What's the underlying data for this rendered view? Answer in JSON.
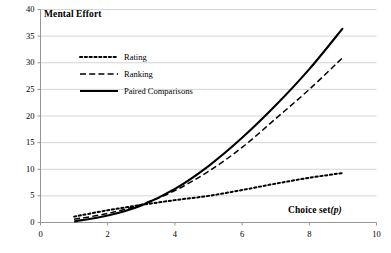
{
  "chart_data": {
    "type": "line",
    "title": "",
    "ylabel": "Mental Effort",
    "xlabel": "Choice set (p)",
    "xlabel_plain": "Choice set",
    "xlabel_italic": "(p)",
    "xlim": [
      0,
      10
    ],
    "ylim": [
      0,
      40
    ],
    "xticks": [
      0,
      2,
      4,
      6,
      8,
      10
    ],
    "yticks": [
      0,
      5,
      10,
      15,
      20,
      25,
      30,
      35,
      40
    ],
    "grid": "horizontal",
    "legend_position": "upper-left-inside",
    "x": [
      1,
      2,
      3,
      4,
      5,
      6,
      7,
      8,
      9
    ],
    "series": [
      {
        "name": "Rating",
        "style": "dotted",
        "color": "#000000",
        "values": [
          1.1,
          2.3,
          3.3,
          4.2,
          5.0,
          6.1,
          7.3,
          8.4,
          9.3
        ]
      },
      {
        "name": "Ranking",
        "style": "dashed",
        "color": "#000000",
        "values": [
          0.6,
          1.7,
          3.4,
          6.0,
          9.6,
          14.1,
          19.5,
          25.0,
          31.0
        ]
      },
      {
        "name": "Paired Comparisons",
        "style": "solid",
        "color": "#000000",
        "values": [
          0.2,
          1.3,
          3.2,
          6.3,
          10.6,
          15.9,
          22.0,
          28.8,
          36.5
        ]
      }
    ]
  },
  "legend": {
    "items": [
      {
        "label": "Rating",
        "key": "dotted-line-key"
      },
      {
        "label": "Ranking",
        "key": "dashed-line-key"
      },
      {
        "label": "Paired Comparisons",
        "key": "solid-line-key"
      }
    ]
  },
  "axes": {
    "y_title": "Mental Effort",
    "x_title_text": "Choice set",
    "x_title_var": "(p)",
    "y_tick_labels": [
      "40",
      "35",
      "30",
      "25",
      "20",
      "15",
      "10",
      "5",
      "0"
    ],
    "x_tick_labels": [
      "0",
      "2",
      "4",
      "6",
      "8",
      "10"
    ]
  },
  "colors": {
    "ink": "#000000",
    "grid": "#c9c9c9",
    "axis": "#8a8a8a",
    "background": "#ffffff"
  }
}
